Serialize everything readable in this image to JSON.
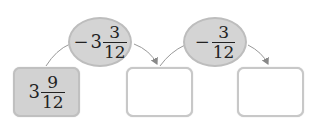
{
  "diagram": {
    "start_box": {
      "whole": "3",
      "numerator": "9",
      "denominator": "12",
      "filled": true
    },
    "operations": [
      {
        "sign": "−",
        "whole": "3",
        "numerator": "3",
        "denominator": "12"
      },
      {
        "sign": "−",
        "whole": "",
        "numerator": "3",
        "denominator": "12"
      }
    ],
    "result_boxes": [
      {
        "value": ""
      },
      {
        "value": ""
      }
    ],
    "colors": {
      "filled_box": "#d2d2d2",
      "oval": "#d4d4d4",
      "border": "#c8c8c8",
      "arrow": "#888888"
    }
  }
}
